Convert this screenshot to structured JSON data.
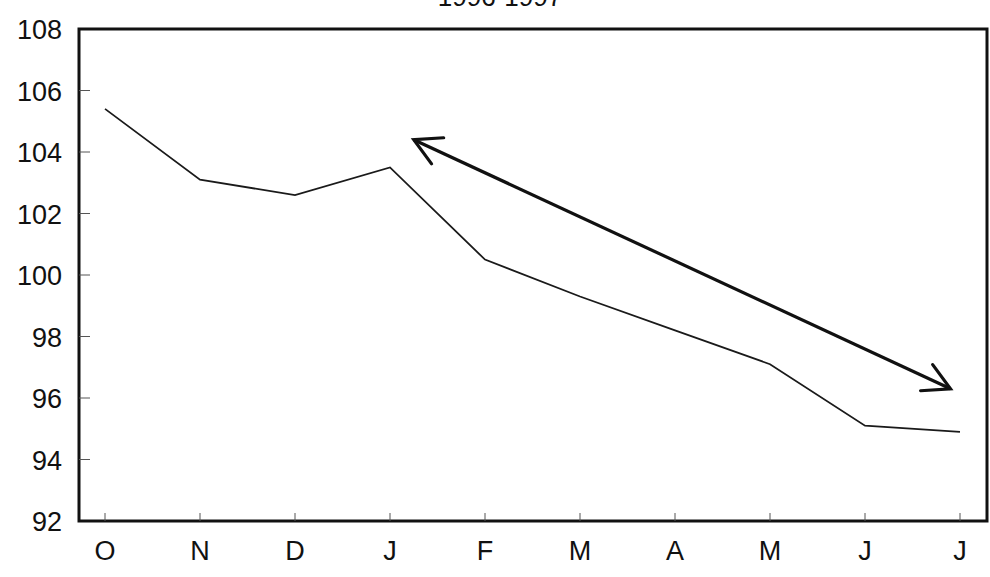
{
  "chart_data": {
    "type": "line",
    "title": "1996-1997",
    "xlabel": "",
    "ylabel": "",
    "categories": [
      "O",
      "N",
      "D",
      "J",
      "F",
      "M",
      "A",
      "M",
      "J",
      "J"
    ],
    "series": [
      {
        "name": "Index",
        "values": [
          105.4,
          103.1,
          102.6,
          103.5,
          100.5,
          99.3,
          98.2,
          97.1,
          95.1,
          94.9
        ]
      }
    ],
    "ylim": [
      92,
      108
    ],
    "yticks": [
      92,
      94,
      96,
      98,
      100,
      102,
      104,
      106,
      108
    ],
    "grid": false,
    "legend": "none",
    "annotations": [
      {
        "type": "double-headed-arrow",
        "description": "Bold double-headed arrow running parallel above the declining segment from January to the final July",
        "from": {
          "x_index": 3.25,
          "y": 104.4
        },
        "to": {
          "x_index": 8.9,
          "y": 96.3
        }
      }
    ]
  },
  "colors": {
    "line": "#1a1a1a",
    "axis": "#111111",
    "background": "#ffffff"
  }
}
